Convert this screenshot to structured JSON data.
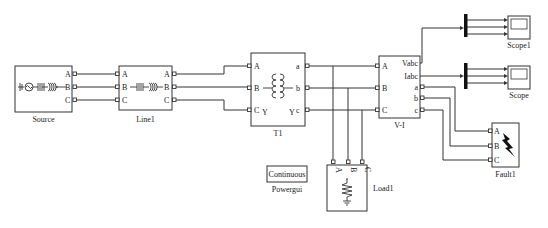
{
  "diagram": {
    "type": "simulink-power-system-model",
    "blocks": {
      "source": {
        "name": "Source",
        "ports_out": [
          "A",
          "B",
          "C"
        ]
      },
      "line1": {
        "name": "Line1",
        "ports_in": [
          "A",
          "B",
          "C"
        ],
        "ports_out": [
          "A",
          "B",
          "C"
        ]
      },
      "t1": {
        "name": "T1",
        "ports_in": [
          "A",
          "B",
          "C"
        ],
        "ports_out": [
          "a",
          "b",
          "c"
        ],
        "primary_winding": "Y",
        "secondary_winding": "Y"
      },
      "vi": {
        "name": "V-I",
        "ports_in": [
          "A",
          "B",
          "C"
        ],
        "ports_out": [
          "Vabc",
          "Iabc",
          "a",
          "b",
          "c"
        ]
      },
      "load1": {
        "name": "Load1",
        "ports_in": [
          "A",
          "B",
          "C"
        ]
      },
      "fault1": {
        "name": "Fault1",
        "ports_in": [
          "A",
          "B",
          "C"
        ]
      },
      "scope1": {
        "name": "Scope1"
      },
      "scope": {
        "name": "Scope"
      },
      "powergui": {
        "name": "Powergui",
        "mode": "Continuous"
      }
    },
    "connections": [
      {
        "from": "Source.A",
        "to": "Line1.A"
      },
      {
        "from": "Source.B",
        "to": "Line1.B"
      },
      {
        "from": "Source.C",
        "to": "Line1.C"
      },
      {
        "from": "Line1.A",
        "to": "T1.A"
      },
      {
        "from": "Line1.B",
        "to": "T1.B"
      },
      {
        "from": "Line1.C",
        "to": "T1.C"
      },
      {
        "from": "T1.a",
        "to": "V-I.A"
      },
      {
        "from": "T1.b",
        "to": "V-I.B"
      },
      {
        "from": "T1.c",
        "to": "V-I.C"
      },
      {
        "from": "T1.a",
        "to": "Load1.A"
      },
      {
        "from": "T1.b",
        "to": "Load1.B"
      },
      {
        "from": "T1.c",
        "to": "Load1.C"
      },
      {
        "from": "V-I.Vabc",
        "to": "Demux1 -> Scope1"
      },
      {
        "from": "V-I.Iabc",
        "to": "Demux2 -> Scope"
      },
      {
        "from": "V-I.a",
        "to": "Fault1.A"
      },
      {
        "from": "V-I.b",
        "to": "Fault1.B"
      },
      {
        "from": "V-I.c",
        "to": "Fault1.C"
      }
    ]
  }
}
